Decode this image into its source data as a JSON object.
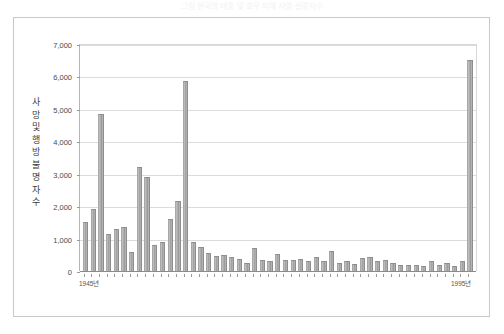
{
  "caption": {
    "top_text": "그림  한국의 태풍 및 호우 피해  사망·실종자수"
  },
  "axis": {
    "y_title_chars": [
      "사",
      "망",
      "및",
      "행",
      "방",
      "불",
      "명",
      "자",
      "수"
    ],
    "y_ticks": [
      "0",
      "1,000",
      "2,000",
      "3,000",
      "4,000",
      "5,000",
      "6,000",
      "7,000"
    ],
    "x_left_label": "1945년",
    "x_right_label": "1995년"
  },
  "colors": {
    "bar_fill": "#b0b0b0",
    "bar_edge": "#8e8e8e",
    "gridline": "#dcdcdc",
    "frame": "#c9c9c9",
    "text": "#4a4a4a"
  },
  "chart_data": {
    "type": "bar",
    "title": "",
    "subtitle": "",
    "xlabel": "",
    "ylabel": "사망 및 행방불명자 수",
    "ylim": [
      0,
      7000
    ],
    "ytick_step": 1000,
    "grid": true,
    "legend": false,
    "categories": [
      "1945",
      "1946",
      "1947",
      "1948",
      "1949",
      "1950",
      "1951",
      "1952",
      "1953",
      "1954",
      "1955",
      "1956",
      "1957",
      "1958",
      "1959",
      "1960",
      "1961",
      "1962",
      "1963",
      "1964",
      "1965",
      "1966",
      "1967",
      "1968",
      "1969",
      "1970",
      "1971",
      "1972",
      "1973",
      "1974",
      "1975",
      "1976",
      "1977",
      "1978",
      "1979",
      "1980",
      "1981",
      "1982",
      "1983",
      "1984",
      "1985",
      "1986",
      "1987",
      "1988",
      "1989",
      "1990",
      "1991",
      "1992",
      "1993",
      "1994",
      "1995"
    ],
    "values": [
      1500,
      1900,
      4850,
      1150,
      1300,
      1350,
      600,
      3200,
      2900,
      800,
      900,
      1600,
      2150,
      5850,
      900,
      750,
      550,
      450,
      500,
      420,
      380,
      250,
      700,
      340,
      300,
      520,
      330,
      340,
      360,
      300,
      420,
      320,
      620,
      260,
      300,
      220,
      410,
      420,
      300,
      330,
      250,
      180,
      200,
      190,
      160,
      310,
      180,
      240,
      160,
      300,
      6500
    ],
    "annotations": [
      {
        "category": "1947",
        "value": 4850
      },
      {
        "category": "1958",
        "value": 5850
      },
      {
        "category": "1995",
        "value": 6500
      }
    ]
  }
}
